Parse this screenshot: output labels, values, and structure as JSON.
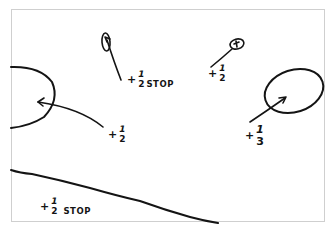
{
  "diagram": {
    "type": "hand-drawn exposure adjustment sketch",
    "ink_color": "#141414",
    "background_color": "#ffffff",
    "frame_color": "#cfcfcf"
  },
  "annotations": [
    {
      "id": "top-center",
      "plus": "+",
      "numerator": "1",
      "denominator": "2",
      "unit": "STOP",
      "target": "small tall oval at top center"
    },
    {
      "id": "top-right",
      "plus": "+",
      "numerator": "1",
      "denominator": "2",
      "unit": "",
      "target": "tiny circle at top right"
    },
    {
      "id": "left",
      "plus": "+",
      "numerator": "1",
      "denominator": "2",
      "unit": "",
      "target": "large oval on left edge"
    },
    {
      "id": "right",
      "plus": "+",
      "numerator": "1",
      "denominator": "3",
      "unit": "",
      "target": "oval on right side"
    },
    {
      "id": "bottom",
      "plus": "+",
      "numerator": "1",
      "denominator": "2",
      "unit": "STOP",
      "target": "region below diagonal line at bottom"
    }
  ]
}
